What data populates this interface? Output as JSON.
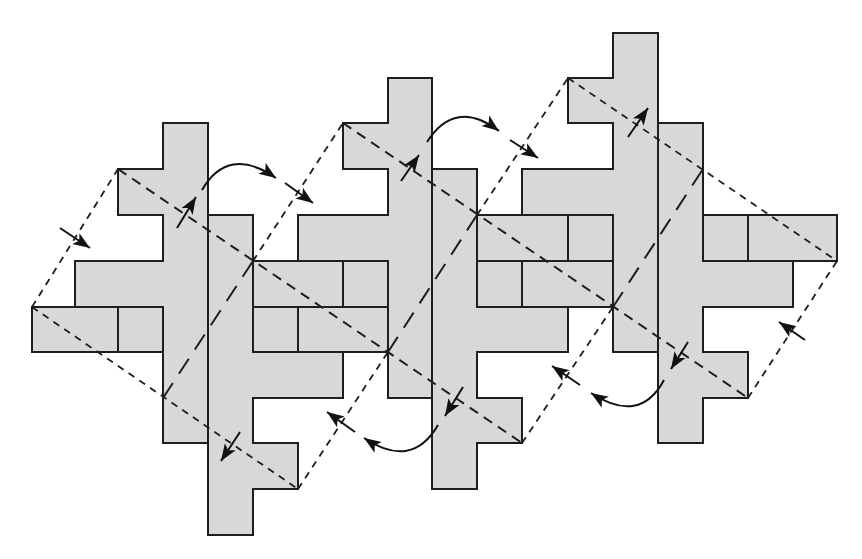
{
  "diagram": {
    "title": "Periodic tiling of cross-shaped polyomino pieces with lattice parallelograms and transformation arrows",
    "colors": {
      "piece_fill": "#d8d8d8",
      "stroke": "#1e1e1e",
      "background": "#ffffff"
    },
    "grid": {
      "cols": [
        32,
        75,
        118,
        163,
        208,
        253,
        298,
        343,
        388,
        432,
        477,
        522,
        568,
        613,
        658,
        703,
        748,
        793,
        837
      ],
      "rows": [
        33,
        78,
        123,
        169,
        215,
        261,
        307,
        352,
        398,
        443,
        489,
        535
      ]
    },
    "pieces": [
      {
        "name": "piece-a",
        "points": [
          [
            3,
            2
          ],
          [
            4,
            2
          ],
          [
            4,
            9
          ],
          [
            3,
            9
          ],
          [
            3,
            6
          ],
          [
            1,
            6
          ],
          [
            1,
            5
          ],
          [
            3,
            5
          ],
          [
            3,
            4
          ],
          [
            2,
            4
          ],
          [
            2,
            3
          ],
          [
            3,
            3
          ]
        ]
      },
      {
        "name": "piece-b",
        "points": [
          [
            4,
            4
          ],
          [
            5,
            4
          ],
          [
            5,
            7
          ],
          [
            7,
            7
          ],
          [
            7,
            8
          ],
          [
            5,
            8
          ],
          [
            5,
            9
          ],
          [
            6,
            9
          ],
          [
            6,
            10
          ],
          [
            5,
            10
          ],
          [
            5,
            11
          ],
          [
            4,
            11
          ]
        ]
      },
      {
        "name": "piece-c",
        "points": [
          [
            8,
            1
          ],
          [
            9,
            1
          ],
          [
            9,
            8
          ],
          [
            8,
            8
          ],
          [
            8,
            5
          ],
          [
            6,
            5
          ],
          [
            6,
            4
          ],
          [
            8,
            4
          ],
          [
            8,
            3
          ],
          [
            7,
            3
          ],
          [
            7,
            2
          ],
          [
            8,
            2
          ]
        ]
      },
      {
        "name": "piece-d",
        "points": [
          [
            9,
            3
          ],
          [
            10,
            3
          ],
          [
            10,
            6
          ],
          [
            12,
            6
          ],
          [
            12,
            7
          ],
          [
            10,
            7
          ],
          [
            10,
            8
          ],
          [
            11,
            8
          ],
          [
            11,
            9
          ],
          [
            10,
            9
          ],
          [
            10,
            10
          ],
          [
            9,
            10
          ]
        ]
      },
      {
        "name": "piece-e",
        "points": [
          [
            13,
            0
          ],
          [
            14,
            0
          ],
          [
            14,
            7
          ],
          [
            13,
            7
          ],
          [
            13,
            4
          ],
          [
            11,
            4
          ],
          [
            11,
            3
          ],
          [
            13,
            3
          ],
          [
            13,
            2
          ],
          [
            12,
            2
          ],
          [
            12,
            1
          ],
          [
            13,
            1
          ]
        ]
      },
      {
        "name": "piece-f",
        "points": [
          [
            14,
            2
          ],
          [
            15,
            2
          ],
          [
            15,
            5
          ],
          [
            17,
            5
          ],
          [
            17,
            6
          ],
          [
            15,
            6
          ],
          [
            15,
            7
          ],
          [
            16,
            7
          ],
          [
            16,
            8
          ],
          [
            15,
            8
          ],
          [
            15,
            9
          ],
          [
            14,
            9
          ]
        ]
      }
    ],
    "boxes": [
      {
        "name": "box-1",
        "rect": [
          0,
          6,
          2,
          7
        ]
      },
      {
        "name": "box-2",
        "rect": [
          2,
          6,
          3,
          7
        ]
      },
      {
        "name": "box-3",
        "rect": [
          5,
          5,
          7,
          6
        ]
      },
      {
        "name": "box-4",
        "rect": [
          7,
          5,
          8,
          6
        ]
      },
      {
        "name": "box-5",
        "rect": [
          5,
          6,
          6,
          7
        ]
      },
      {
        "name": "box-6",
        "rect": [
          6,
          6,
          8,
          7
        ]
      },
      {
        "name": "box-7",
        "rect": [
          10,
          4,
          12,
          5
        ]
      },
      {
        "name": "box-8",
        "rect": [
          12,
          4,
          13,
          5
        ]
      },
      {
        "name": "box-9",
        "rect": [
          10,
          5,
          11,
          6
        ]
      },
      {
        "name": "box-10",
        "rect": [
          11,
          5,
          13,
          6
        ]
      },
      {
        "name": "box-11",
        "rect": [
          15,
          4,
          16,
          5
        ]
      },
      {
        "name": "box-12",
        "rect": [
          16,
          4,
          18,
          5
        ]
      }
    ],
    "lattice_lines": [
      {
        "name": "edge-left-outer",
        "style": "short",
        "from": [
          0,
          6
        ],
        "to": [
          2,
          3
        ]
      },
      {
        "name": "edge-bottom-1",
        "style": "short",
        "from": [
          0,
          6
        ],
        "to": [
          6,
          10
        ]
      },
      {
        "name": "midline-1",
        "style": "long",
        "from": [
          3,
          8
        ],
        "to": [
          5,
          5
        ]
      },
      {
        "name": "edge-right-1",
        "style": "short",
        "from": [
          6,
          10
        ],
        "to": [
          8,
          7
        ]
      },
      {
        "name": "edge-diag-b1",
        "style": "medium",
        "from": [
          2,
          3
        ],
        "to": [
          11,
          9
        ]
      },
      {
        "name": "edge-left-2",
        "style": "short",
        "from": [
          5,
          5
        ],
        "to": [
          7,
          2
        ]
      },
      {
        "name": "midline-2",
        "style": "long",
        "from": [
          8,
          7
        ],
        "to": [
          10,
          4
        ]
      },
      {
        "name": "edge-right-2",
        "style": "short",
        "from": [
          11,
          9
        ],
        "to": [
          13,
          6
        ]
      },
      {
        "name": "edge-diag-b2",
        "style": "medium",
        "from": [
          7,
          2
        ],
        "to": [
          16,
          8
        ]
      },
      {
        "name": "edge-left-3",
        "style": "short",
        "from": [
          10,
          4
        ],
        "to": [
          12,
          1
        ]
      },
      {
        "name": "midline-3",
        "style": "long",
        "from": [
          13,
          6
        ],
        "to": [
          15,
          3
        ]
      },
      {
        "name": "edge-right-3",
        "style": "short",
        "from": [
          16,
          8
        ],
        "to": [
          18,
          5
        ]
      },
      {
        "name": "edge-top-3",
        "style": "short",
        "from": [
          12,
          1
        ],
        "to": [
          18,
          5
        ]
      }
    ],
    "arrows": [
      {
        "name": "arrow-left-inward",
        "type": "straight",
        "from": [
          60,
          228
        ],
        "to": [
          90,
          248
        ]
      },
      {
        "name": "arrow-a-up",
        "type": "straight",
        "from": [
          177,
          228
        ],
        "to": [
          196,
          197
        ]
      },
      {
        "name": "arrow-a-curve",
        "type": "curve",
        "from": [
          202,
          190
        ],
        "ctrl": [
          228,
          145
        ],
        "to": [
          276,
          178
        ]
      },
      {
        "name": "arrow-a-right",
        "type": "straight",
        "from": [
          285,
          183
        ],
        "to": [
          313,
          203
        ]
      },
      {
        "name": "arrow-b-down",
        "type": "straight",
        "from": [
          240,
          432
        ],
        "to": [
          221,
          461
        ]
      },
      {
        "name": "arrow-c-up",
        "type": "straight",
        "from": [
          401,
          181
        ],
        "to": [
          419,
          155
        ]
      },
      {
        "name": "arrow-c-curve",
        "type": "curve",
        "from": [
          427,
          142
        ],
        "ctrl": [
          455,
          98
        ],
        "to": [
          499,
          131
        ]
      },
      {
        "name": "arrow-c-right",
        "type": "straight",
        "from": [
          510,
          140
        ],
        "to": [
          538,
          158
        ]
      },
      {
        "name": "arrow-d-down",
        "type": "straight",
        "from": [
          463,
          387
        ],
        "to": [
          445,
          416
        ]
      },
      {
        "name": "arrow-d-curve",
        "type": "curve",
        "from": [
          438,
          425
        ],
        "ctrl": [
          412,
          470
        ],
        "to": [
          364,
          438
        ]
      },
      {
        "name": "arrow-d-left",
        "type": "straight",
        "from": [
          355,
          432
        ],
        "to": [
          327,
          412
        ]
      },
      {
        "name": "arrow-e-up",
        "type": "straight",
        "from": [
          628,
          137
        ],
        "to": [
          648,
          108
        ]
      },
      {
        "name": "arrow-f-down",
        "type": "straight",
        "from": [
          688,
          342
        ],
        "to": [
          671,
          369
        ]
      },
      {
        "name": "arrow-f-curve",
        "type": "curve",
        "from": [
          664,
          380
        ],
        "ctrl": [
          640,
          425
        ],
        "to": [
          591,
          393
        ]
      },
      {
        "name": "arrow-f-left",
        "type": "straight",
        "from": [
          580,
          385
        ],
        "to": [
          552,
          366
        ]
      },
      {
        "name": "arrow-right-inward",
        "type": "straight",
        "from": [
          805,
          340
        ],
        "to": [
          779,
          322
        ]
      }
    ]
  }
}
